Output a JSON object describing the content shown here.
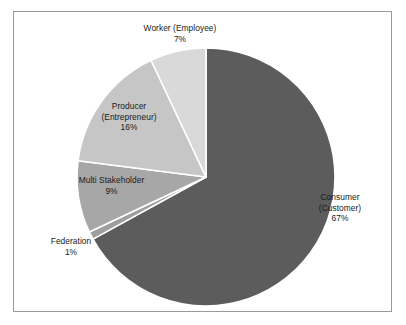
{
  "top_clip": {
    "ghost_text": ""
  },
  "chart_data": {
    "type": "pie",
    "title": "",
    "subtitle": "",
    "xlabel": "",
    "ylabel": "",
    "legend_position": "none",
    "grid": false,
    "labels_on_slices": true,
    "label_format": "name + percent",
    "start_angle_deg": 0,
    "direction": "clockwise",
    "categories": [
      "Consumer (Customer)",
      "Worker (Employee)",
      "Producer (Entrepreneur)",
      "Multi Stakeholder",
      "Federation"
    ],
    "values": [
      67,
      7,
      16,
      9,
      1
    ],
    "units": "percent",
    "total": 100,
    "slices": [
      {
        "name": "Consumer (Customer)",
        "name_line1": "Consumer",
        "name_line2": "(Customer)",
        "value": 67,
        "percent_label": "67%",
        "color": "#5c5c5c",
        "start_deg": 0,
        "end_deg": 241.2
      },
      {
        "name": "Federation",
        "name_line1": "Federation",
        "name_line2": "",
        "value": 1,
        "percent_label": "1%",
        "color": "#9e9e9e",
        "start_deg": 241.2,
        "end_deg": 244.8
      },
      {
        "name": "Multi Stakeholder",
        "name_line1": "Multi Stakeholder",
        "name_line2": "",
        "value": 9,
        "percent_label": "9%",
        "color": "#a7a7a7",
        "start_deg": 244.8,
        "end_deg": 277.2
      },
      {
        "name": "Producer (Entrepreneur)",
        "name_line1": "Producer",
        "name_line2": "(Entrepreneur)",
        "value": 16,
        "percent_label": "16%",
        "color": "#c6c6c6",
        "start_deg": 277.2,
        "end_deg": 334.8
      },
      {
        "name": "Worker (Employee)",
        "name_line1": "Worker (Employee)",
        "name_line2": "",
        "value": 7,
        "percent_label": "7%",
        "color": "#d9d9d9",
        "start_deg": 334.8,
        "end_deg": 360
      }
    ],
    "colors": {
      "consumer": "#5c5c5c",
      "federation": "#9e9e9e",
      "multi_stakeholder": "#a7a7a7",
      "producer": "#c6c6c6",
      "worker": "#d9d9d9",
      "slice_border": "#ffffff",
      "plot_background": "#ffffff",
      "frame_border": "#9a9a9a",
      "label_text": "#1a1a1a"
    }
  }
}
